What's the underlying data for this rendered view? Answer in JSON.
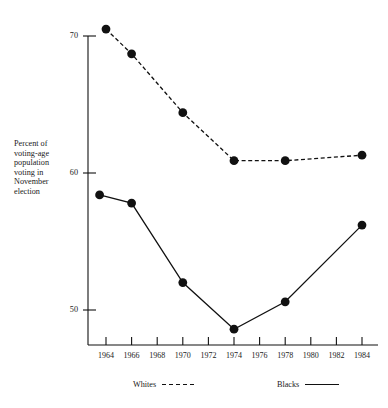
{
  "figure": {
    "cropped_header_text": "",
    "y_axis_title_lines": [
      "Percent of",
      "voting-age",
      "population",
      "voting in",
      "November",
      "election"
    ]
  },
  "legend": {
    "position": "bottom",
    "entries": [
      {
        "label": "Whites",
        "style": "dashed"
      },
      {
        "label": "Blacks",
        "style": "solid"
      }
    ]
  },
  "colors": {
    "ink": "#111111",
    "background": "#ffffff"
  },
  "chart_data": {
    "type": "line",
    "title": "",
    "subtitle": "",
    "xlabel": "",
    "ylabel": "Percent of voting-age population voting in November election",
    "x": [
      1964,
      1966,
      1968,
      1970,
      1972,
      1974,
      1976,
      1978,
      1980,
      1982,
      1984
    ],
    "x_tick_labels": [
      "1964",
      "1966",
      "1968",
      "1970",
      "1972",
      "1974",
      "1976",
      "1978",
      "1980",
      "1982",
      "1984"
    ],
    "xlim": [
      1963,
      1985
    ],
    "ylim": [
      47.5,
      71.5
    ],
    "y_tick_labels": [
      "50",
      "60",
      "70"
    ],
    "y_ticks": [
      50,
      60,
      70
    ],
    "grid": false,
    "legend_position": "bottom",
    "series": [
      {
        "name": "Whites",
        "style": "dashed",
        "marker": "filled-circle",
        "points": [
          {
            "x": 1964,
            "y": 70.5
          },
          {
            "x": 1966,
            "y": 68.7
          },
          {
            "x": 1970,
            "y": 64.4
          },
          {
            "x": 1974,
            "y": 60.9
          },
          {
            "x": 1978,
            "y": 60.9
          },
          {
            "x": 1984,
            "y": 61.3
          }
        ]
      },
      {
        "name": "Blacks",
        "style": "solid",
        "marker": "filled-circle",
        "points": [
          {
            "x": 1963.5,
            "y": 58.4
          },
          {
            "x": 1966,
            "y": 57.8
          },
          {
            "x": 1970,
            "y": 52.0
          },
          {
            "x": 1974,
            "y": 48.6
          },
          {
            "x": 1978,
            "y": 50.6
          },
          {
            "x": 1984,
            "y": 56.2
          }
        ]
      }
    ]
  }
}
